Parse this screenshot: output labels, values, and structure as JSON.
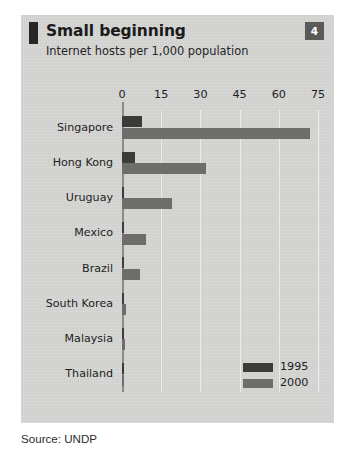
{
  "figure": {
    "title": "Small beginning",
    "subtitle": "Internet hosts per 1,000 population",
    "badge": "4",
    "source": "Source: UNDP",
    "colors": {
      "panel_background": "#d4d4d2",
      "series_1995": "#3b3b39",
      "series_2000": "#6d6d6b",
      "badge_background": "#5a5a58",
      "accent_mark": "#262626",
      "gridline": "#ececeb",
      "axis": "#8a8a88"
    }
  },
  "legend": {
    "position": "inside-bottom-right",
    "entries": [
      {
        "label": "1995",
        "color": "#3b3b39"
      },
      {
        "label": "2000",
        "color": "#6d6d6b"
      }
    ]
  },
  "chart_data": {
    "type": "bar",
    "orientation": "horizontal",
    "title": "Small beginning",
    "subtitle": "Internet hosts per 1,000 population",
    "xlabel": "",
    "ylabel": "",
    "xlim": [
      0,
      75
    ],
    "xticks": [
      0,
      15,
      30,
      45,
      60,
      75
    ],
    "ticklabels": [
      "0",
      "15",
      "30",
      "45",
      "60",
      "75"
    ],
    "grid": true,
    "grid_axis": "x",
    "categories": [
      "Singapore",
      "Hong Kong",
      "Uruguay",
      "Mexico",
      "Brazil",
      "South Korea",
      "Malaysia",
      "Thailand"
    ],
    "series": [
      {
        "name": "1995",
        "color": "#3b3b39",
        "values": [
          7.5,
          5.0,
          0.5,
          0.4,
          0.3,
          0.3,
          0.3,
          0.2
        ]
      },
      {
        "name": "2000",
        "color": "#6d6d6b",
        "values": [
          72.0,
          32.0,
          19.0,
          9.0,
          7.0,
          1.6,
          1.2,
          0.8
        ]
      }
    ],
    "source": "Source: UNDP"
  }
}
